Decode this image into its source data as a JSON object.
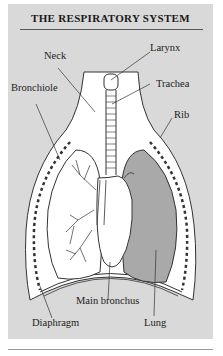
{
  "title": "THE RESPIRATORY SYSTEM",
  "labels": {
    "neck": "Neck",
    "larynx": "Larynx",
    "trachea": "Trachea",
    "bronchiole": "Bronchiole",
    "rib": "Rib",
    "main_bronchus": "Main bronchus",
    "diaphragm": "Diaphragm",
    "lung": "Lung"
  },
  "colors": {
    "panel_bg": "#d9d9d9",
    "body_fill": "#ffffff",
    "lung_shade": "#a9a9a9",
    "line": "#333333"
  }
}
